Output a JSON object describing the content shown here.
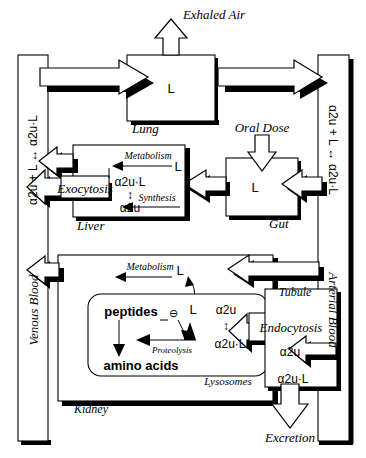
{
  "diagram": {
    "symbols": {
      "ligand": "L",
      "protein": "α2u",
      "complex": "α2u·L",
      "binding_equilibrium": "α2u + L ↔ α2u·L",
      "inhibition": "⊖",
      "double_arrow_v": "↕"
    },
    "blood": {
      "venous": {
        "name": "Venous Blood",
        "equilibrium": "α2u + L ↔ α2u·L"
      },
      "arterial": {
        "name": "Arterial Blood",
        "equilibrium": "α2u + L ↔ α2u·L"
      }
    },
    "compartments": [
      {
        "id": "lung",
        "name": "Lung",
        "contents": [
          "L"
        ],
        "outflow_label": "Exhaled Air"
      },
      {
        "id": "gut",
        "name": "Gut",
        "contents": [
          "L"
        ],
        "inflow_label": "Oral Dose"
      },
      {
        "id": "liver",
        "name": "Liver",
        "contents": [
          "L",
          "α2u·L",
          "α2u"
        ],
        "processes": [
          "Metabolism",
          "Synthesis",
          "Exocytosis"
        ]
      },
      {
        "id": "kidney",
        "name": "Kidney",
        "contents": [
          "L"
        ],
        "processes": [
          "Metabolism",
          "Endocytosis"
        ],
        "sub_compartments": [
          {
            "id": "lysosomes",
            "name": "Lysosomes",
            "contents": [
              "peptides",
              "L",
              "α2u",
              "α2u·L",
              "amino acids"
            ],
            "processes": [
              "Proteolysis"
            ],
            "inhibition_symbol": "⊖"
          },
          {
            "id": "tubule",
            "name": "Tubule",
            "contents": [
              "α2u",
              "α2u·L"
            ],
            "outflow_label": "Excretion"
          }
        ]
      }
    ],
    "flow_labels": {
      "exhaled_air": "Exhaled Air",
      "oral_dose": "Oral Dose",
      "excretion": "Excretion",
      "exocytosis": "Exocytosis",
      "endocytosis": "Endocytosis",
      "metabolism_liver": "Metabolism",
      "metabolism_kidney": "Metabolism",
      "synthesis": "Synthesis",
      "proteolysis": "Proteolysis"
    },
    "colors": {
      "stroke": "#000000",
      "fill": "#ffffff",
      "shadow": "#000000",
      "background": "#ffffff"
    }
  }
}
